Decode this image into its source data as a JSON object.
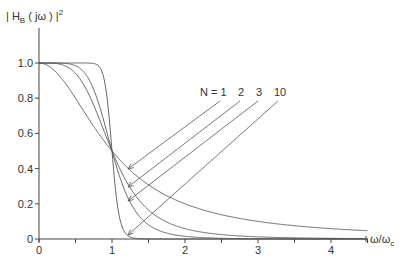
{
  "chart_data": {
    "type": "line",
    "title": "",
    "ylabel": "| H_B (jω) |²",
    "ylabel_parts": {
      "pre": "| H",
      "sub": "B",
      "mid": " ( jω ) |",
      "sup": "2"
    },
    "xlabel": "ω/ω_c",
    "xlabel_parts": {
      "main": "ω/ω",
      "sub": "c"
    },
    "xlim": [
      0,
      4.5
    ],
    "ylim": [
      0,
      1.0
    ],
    "x_ticks": [
      0,
      1,
      2,
      3,
      4
    ],
    "x_tick_labels": [
      "0",
      "1",
      "2",
      "3",
      "4"
    ],
    "x_minor_ticks": [
      0.5,
      1.5,
      2.5,
      3.5,
      4.5
    ],
    "y_ticks": [
      0,
      0.2,
      0.4,
      0.6,
      0.8,
      1.0
    ],
    "y_tick_labels": [
      "0",
      "0.2",
      "0.4",
      "0.6",
      "0.8",
      "1.0"
    ],
    "grid": false,
    "formula": "|H_B(jω)|² = 1 / (1 + (ω/ω_c)^(2N))",
    "series": [
      {
        "name": "N = 1",
        "order": 1,
        "label": "N = 1",
        "x": [
          0,
          0.5,
          1,
          1.5,
          2,
          3,
          4,
          4.5
        ],
        "values": [
          1.0,
          0.8,
          0.5,
          0.31,
          0.2,
          0.1,
          0.06,
          0.047
        ]
      },
      {
        "name": "N = 2",
        "order": 2,
        "label": "2",
        "x": [
          0,
          0.5,
          1,
          1.5,
          2,
          3,
          4,
          4.5
        ],
        "values": [
          1.0,
          0.94,
          0.5,
          0.16,
          0.06,
          0.012,
          0.004,
          0.002
        ]
      },
      {
        "name": "N = 3",
        "order": 3,
        "label": "3",
        "x": [
          0,
          0.5,
          1,
          1.5,
          2,
          3,
          4,
          4.5
        ],
        "values": [
          1.0,
          0.98,
          0.5,
          0.08,
          0.015,
          0.001,
          0.0,
          0.0
        ]
      },
      {
        "name": "N = 10",
        "order": 10,
        "label": "10",
        "x": [
          0,
          0.5,
          0.9,
          1,
          1.1,
          1.2,
          1.5,
          4.5
        ],
        "values": [
          1.0,
          1.0,
          0.89,
          0.5,
          0.13,
          0.025,
          0.0,
          0.0
        ]
      }
    ],
    "annotations": [
      {
        "text": "N = 1",
        "points_to_series": "N = 1",
        "arrow_tip": [
          1.22,
          0.4
        ]
      },
      {
        "text": "2",
        "points_to_series": "N = 2",
        "arrow_tip": [
          1.22,
          0.29
        ]
      },
      {
        "text": "3",
        "points_to_series": "N = 3",
        "arrow_tip": [
          1.22,
          0.21
        ]
      },
      {
        "text": "10",
        "points_to_series": "N = 10",
        "arrow_tip": [
          1.22,
          0.02
        ]
      }
    ],
    "legend": "inline annotations with arrows"
  },
  "layout": {
    "x0": 39,
    "y0": 239,
    "px_per_x": 73,
    "px_per_y": 176,
    "axis_x_end": 366,
    "axis_y_top": 28,
    "annotation_label_y": 96,
    "annotation_label_x": [
      200,
      238,
      256,
      274
    ],
    "arrow_starts": [
      [
        220,
        101
      ],
      [
        240,
        101
      ],
      [
        258,
        101
      ],
      [
        278,
        101
      ]
    ],
    "arrow_ends": [
      [
        128,
        169
      ],
      [
        128,
        187
      ],
      [
        128,
        201
      ],
      [
        128,
        235
      ]
    ]
  }
}
